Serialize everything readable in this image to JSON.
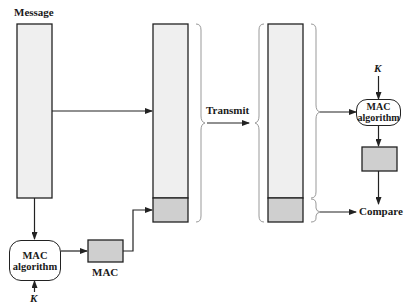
{
  "labels": {
    "message": "Message",
    "transmit": "Transmit",
    "mac": "MAC",
    "compare": "Compare",
    "key_sender": "K",
    "key_receiver": "K"
  },
  "sender_mac_algorithm": {
    "line1": "MAC",
    "line2": "algorithm"
  },
  "receiver_mac_algorithm": {
    "line1": "MAC",
    "line2": "algorithm"
  },
  "colors": {
    "message_fill": "#efefef",
    "mac_fill": "#cfcfcf",
    "stroke": "#222222",
    "brace": "#999999"
  }
}
